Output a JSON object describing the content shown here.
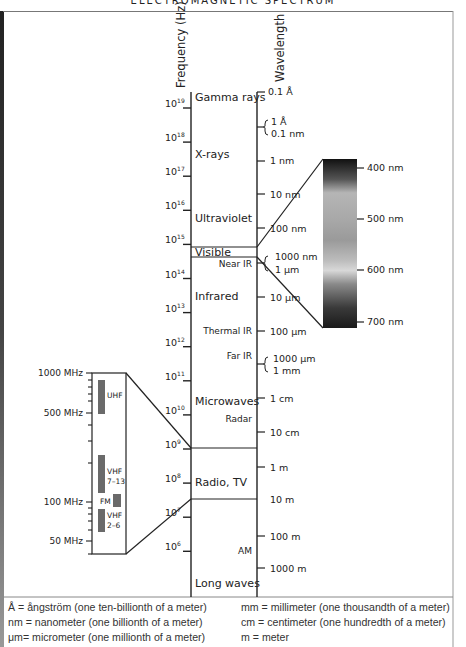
{
  "title": "ELECTROMAGNETIC SPECTRUM",
  "axes": {
    "frequency_label": "Frequency (Hz)",
    "wavelength_label": "Wavelength"
  },
  "frequency_ticks": [
    {
      "base": "10",
      "exp": "19"
    },
    {
      "base": "10",
      "exp": "18"
    },
    {
      "base": "10",
      "exp": "17"
    },
    {
      "base": "10",
      "exp": "16"
    },
    {
      "base": "10",
      "exp": "15"
    },
    {
      "base": "10",
      "exp": "14"
    },
    {
      "base": "10",
      "exp": "13"
    },
    {
      "base": "10",
      "exp": "12"
    },
    {
      "base": "10",
      "exp": "11"
    },
    {
      "base": "10",
      "exp": "10"
    },
    {
      "base": "10",
      "exp": "9"
    },
    {
      "base": "10",
      "exp": "8"
    },
    {
      "base": "10",
      "exp": "7"
    },
    {
      "base": "10",
      "exp": "6"
    }
  ],
  "bands": {
    "gamma": "Gamma rays",
    "xrays": "X-rays",
    "ultraviolet": "Ultraviolet",
    "visible": "Visible",
    "near_ir": "Near IR",
    "infrared": "Infrared",
    "thermal_ir": "Thermal IR",
    "far_ir": "Far IR",
    "microwaves": "Microwaves",
    "radar": "Radar",
    "radio_tv": "Radio, TV",
    "am": "AM",
    "long_waves": "Long waves"
  },
  "wavelength_ticks": {
    "w0": "0.1 Å",
    "w1a": "1 Å",
    "w1b": "0.1 nm",
    "w2": "1 nm",
    "w3": "10 nm",
    "w4": "100 nm",
    "w5a": "1000 nm",
    "w5b": "1 μm",
    "w6": "10 μm",
    "w7": "100 μm",
    "w8a": "1000 μm",
    "w8b": "1 mm",
    "w9": "1 cm",
    "w10": "10 cm",
    "w11": "1 m",
    "w12": "10 m",
    "w13": "100 m",
    "w14": "1000 m"
  },
  "visible_spectrum": {
    "labels": [
      "400 nm",
      "500 nm",
      "600 nm",
      "700 nm"
    ]
  },
  "radio_inset": {
    "scale_labels": [
      "1000 MHz",
      "500 MHz",
      "100 MHz",
      "50 MHz"
    ],
    "uhf": "UHF",
    "vhf_high_a": "VHF",
    "vhf_high_b": "7–13",
    "fm": "FM",
    "vhf_low_a": "VHF",
    "vhf_low_b": "2–6"
  },
  "legend": {
    "left": [
      "Å = ångström (one ten-billionth of a meter)",
      "nm = nanometer (one billionth of a meter)",
      "μm= micrometer (one millionth of a meter)"
    ],
    "right": [
      "mm = millimeter (one thousandth of a meter)",
      "cm  = centimeter (one hundredth of a meter)",
      "m = meter"
    ]
  }
}
